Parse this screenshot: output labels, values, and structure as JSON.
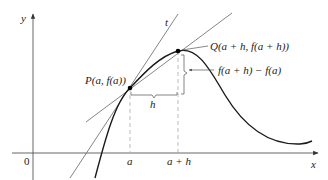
{
  "diagram": {
    "axes": {
      "x_label": "x",
      "y_label": "y",
      "origin_label": "0",
      "tick_labels": [
        "a",
        "a + h"
      ]
    },
    "points": {
      "P": "P(a, f(a))",
      "Q": "Q(a + h, f(a + h))"
    },
    "lines": {
      "tangent_label": "t"
    },
    "annotations": {
      "h_label": "h",
      "rise_label": "f(a + h) − f(a)"
    },
    "colors": {
      "curve": "#1a1a1a",
      "lines": "#777777",
      "axes": "#444444",
      "dashed": "#aaaaaa",
      "point": "#000000"
    }
  }
}
